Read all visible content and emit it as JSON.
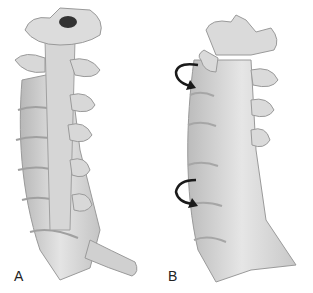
{
  "figure": {
    "panels": [
      {
        "label": "A",
        "description": "Cervical spine, posterior-oblique view, rendered bone"
      },
      {
        "label": "B",
        "description": "Cervical spine, posterior-oblique view, smoothed with rotation arrows"
      }
    ],
    "annotations": {
      "arrows": [
        {
          "panel": "B",
          "type": "curved-arrow",
          "position": "upper"
        },
        {
          "panel": "B",
          "type": "curved-arrow",
          "position": "lower"
        }
      ]
    },
    "colors": {
      "bone_light": "#e6e6e6",
      "bone_mid": "#c8c8c8",
      "bone_dark": "#9a9a9a",
      "arrow": "#1a1a1a",
      "background": "#ffffff"
    }
  }
}
